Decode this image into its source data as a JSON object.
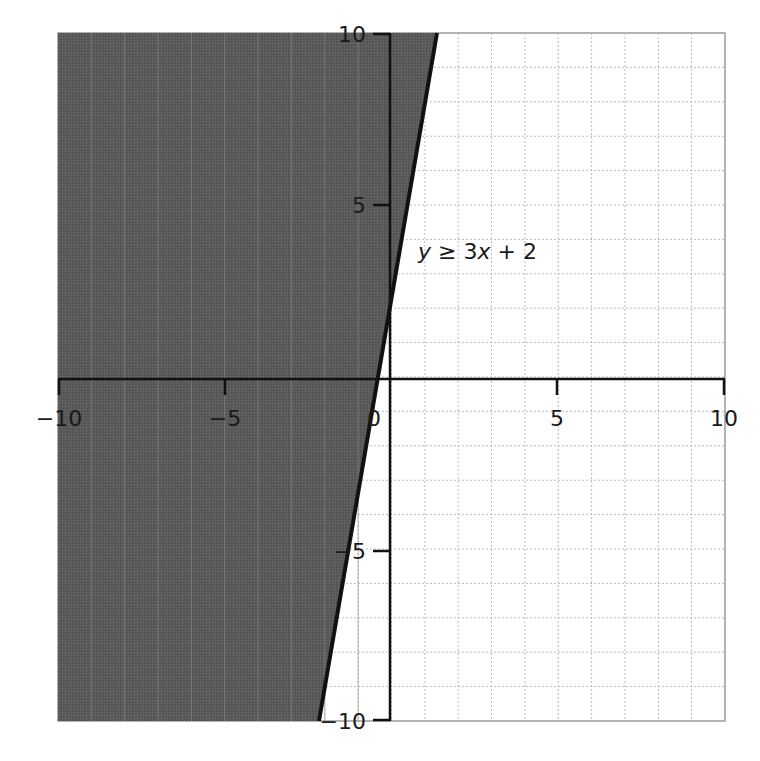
{
  "chart_data": {
    "type": "area",
    "title": "",
    "xlabel": "",
    "ylabel": "",
    "xlim": [
      -10,
      10
    ],
    "ylim": [
      -10,
      10
    ],
    "grid": true,
    "grid_step": 1,
    "x_ticks": [
      -10,
      -5,
      0,
      5,
      10
    ],
    "y_ticks": [
      -10,
      -5,
      5,
      10
    ],
    "x_tick_labels": [
      "−10",
      "−5",
      "0",
      "5",
      "10"
    ],
    "y_tick_labels": [
      "−10",
      "−5",
      "5",
      "10"
    ],
    "boundary": {
      "equation": "y = 3x + 2",
      "style": "solid",
      "points": [
        [
          -4,
          -10
        ],
        [
          2.667,
          10
        ]
      ]
    },
    "shaded_region": "left of / above line",
    "annotation": {
      "text_parts": [
        "y",
        " ≥ 3",
        "x",
        " + 2"
      ],
      "position": [
        1,
        4
      ]
    },
    "colors": {
      "shade": "#5a5a5a",
      "line": "#111111",
      "grid": "#bdbdbd",
      "axis": "#111111"
    }
  },
  "labels": {
    "x_neg10": "−10",
    "x_neg5": "−5",
    "x_0": "0",
    "x_5": "5",
    "x_10": "10",
    "y_10": "10",
    "y_5": "5",
    "y_neg5": "−5",
    "y_neg10": "−10",
    "ineq_y": "y",
    "ineq_mid": " ≥ 3",
    "ineq_x": "x",
    "ineq_end": " + 2"
  }
}
